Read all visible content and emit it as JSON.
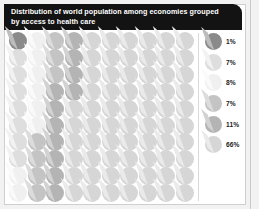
{
  "header": {
    "title": "Distribution of world population among economies grouped\nby access to health care",
    "background_color": "#131313",
    "text_color": "#ffffff"
  },
  "legend": {
    "entries": [
      {
        "label": "1%",
        "color": "#8a8a8a",
        "wedge_color": "#bdbdbd"
      },
      {
        "label": "7%",
        "color": "#dedede",
        "wedge_color": "#f2f2f2"
      },
      {
        "label": "8%",
        "color": "#f0f0f0",
        "wedge_color": "#fafafa"
      },
      {
        "label": "7%",
        "color": "#c4c4c4",
        "wedge_color": "#dcdcdc"
      },
      {
        "label": "11%",
        "color": "#b4b4b4",
        "wedge_color": "#d2d2d2"
      },
      {
        "label": "66%",
        "color": "#d6d6d6",
        "wedge_color": "#eaeaea"
      }
    ]
  },
  "chart_data": {
    "type": "pie",
    "title": "Distribution of world population among economies grouped by access to health care",
    "subtitle": "",
    "xlabel": "",
    "ylabel": "",
    "grid": false,
    "legend_position": "right",
    "unit": "1 dot = 1% of world population",
    "total_dots": 100,
    "grid_rows": 10,
    "grid_columns": 10,
    "categories": [
      "1%",
      "7%",
      "8%",
      "7%",
      "11%",
      "66%"
    ],
    "values": [
      1,
      7,
      8,
      7,
      11,
      66
    ],
    "colors": [
      "#8a8a8a",
      "#dedede",
      "#f0f0f0",
      "#c4c4c4",
      "#b4b4b4",
      "#d6d6d6"
    ],
    "dot_fill_order": [
      0,
      1,
      1,
      1,
      1,
      1,
      1,
      1,
      2,
      2,
      2,
      2,
      2,
      2,
      2,
      2,
      3,
      3,
      3,
      3,
      3,
      3,
      3,
      4,
      4,
      4,
      4,
      4,
      4,
      4,
      4,
      4,
      4,
      4,
      5,
      5,
      5,
      5,
      5,
      5,
      5,
      5,
      5,
      5,
      5,
      5,
      5,
      5,
      5,
      5,
      5,
      5,
      5,
      5,
      5,
      5,
      5,
      5,
      5,
      5,
      5,
      5,
      5,
      5,
      5,
      5,
      5,
      5,
      5,
      5,
      5,
      5,
      5,
      5,
      5,
      5,
      5,
      5,
      5,
      5,
      5,
      5,
      5,
      5,
      5,
      5,
      5,
      5,
      5,
      5,
      5,
      5,
      5,
      5,
      5,
      5,
      5,
      5,
      5,
      5
    ]
  }
}
